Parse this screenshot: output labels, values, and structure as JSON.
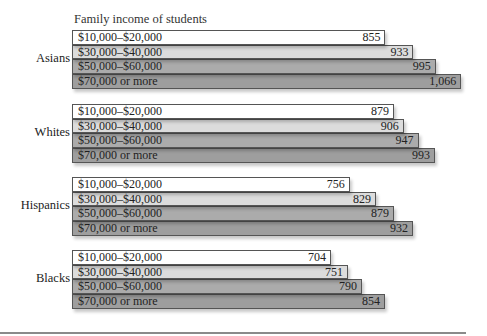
{
  "chart_data": {
    "type": "bar",
    "orientation": "horizontal",
    "title": "Family income of students",
    "xlabel": "",
    "ylabel": "",
    "grid": false,
    "legend": "inline category labels inside bars",
    "groups": [
      "Asians",
      "Whites",
      "Hispanics",
      "Blacks"
    ],
    "categories": [
      "$10,000–$20,000",
      "$30,000–$40,000",
      "$50,000–$60,000",
      "$70,000 or more"
    ],
    "series": [
      {
        "name": "Asians",
        "values": [
          855,
          933,
          995,
          1066
        ],
        "labels": [
          "855",
          "933",
          "995",
          "1,066"
        ]
      },
      {
        "name": "Whites",
        "values": [
          879,
          906,
          947,
          993
        ],
        "labels": [
          "879",
          "906",
          "947",
          "993"
        ]
      },
      {
        "name": "Hispanics",
        "values": [
          756,
          829,
          879,
          932
        ],
        "labels": [
          "756",
          "829",
          "879",
          "932"
        ]
      },
      {
        "name": "Blacks",
        "values": [
          704,
          751,
          790,
          854
        ],
        "labels": [
          "704",
          "751",
          "790",
          "854"
        ]
      }
    ],
    "colors": [
      "#ffffff",
      "#dcdcdc",
      "#ababab",
      "#9e9e9e"
    ]
  }
}
